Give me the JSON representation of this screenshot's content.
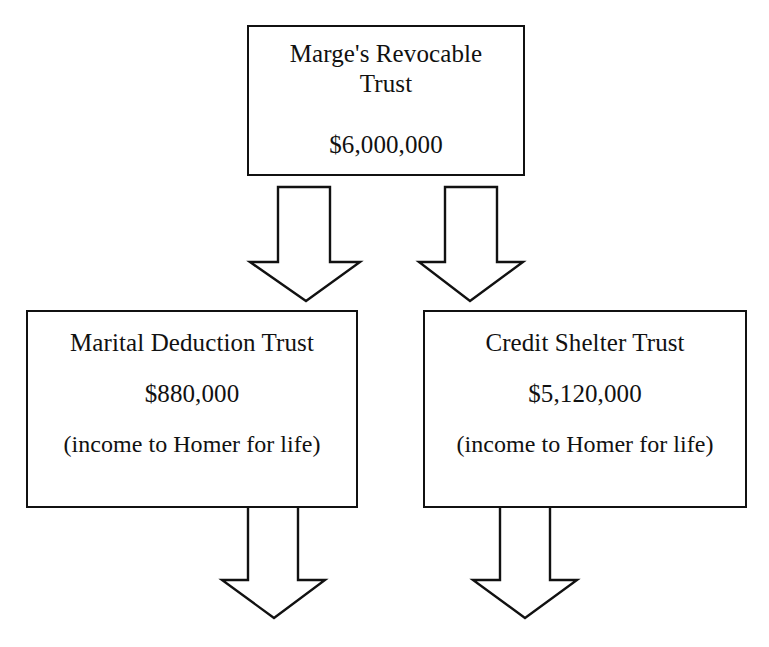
{
  "diagram": {
    "type": "estate-planning-flow-diagram",
    "background_color": "#ffffff",
    "line_color": "#111111",
    "text_color": "#111111",
    "nodes": [
      {
        "id": "root",
        "title": "Marge's Revocable\nTrust",
        "amount": "$6,000,000",
        "note": ""
      },
      {
        "id": "marital",
        "title": "Marital Deduction Trust",
        "amount": "$880,000",
        "note": "(income to Homer for life)"
      },
      {
        "id": "credit",
        "title": "Credit Shelter Trust",
        "amount": "$5,120,000",
        "note": "(income to Homer for life)"
      }
    ],
    "arrows": [
      {
        "id": "root-to-marital",
        "from": "root",
        "to": "marital",
        "direction": "down"
      },
      {
        "id": "root-to-credit",
        "from": "root",
        "to": "credit",
        "direction": "down"
      },
      {
        "id": "marital-outflow",
        "from": "marital",
        "to": "",
        "direction": "down"
      },
      {
        "id": "credit-outflow",
        "from": "credit",
        "to": "",
        "direction": "down"
      }
    ]
  }
}
